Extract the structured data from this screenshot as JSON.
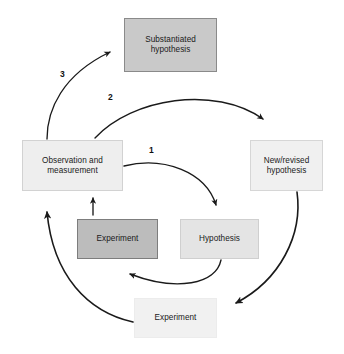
{
  "diagram": {
    "background_color": "#ffffff",
    "nodes": {
      "substantiated_hypothesis": {
        "label": "Substantiated\nhypothesis",
        "fill": "#c9c9c9",
        "border": "#8a8a8a"
      },
      "observation_and_measurement": {
        "label": "Observation and\nmeasurement",
        "fill": "#eeeeee",
        "border": "#d2d2d2"
      },
      "new_revised_hypothesis": {
        "label": "New/revised\nhypothesis",
        "fill": "#f0f0f0",
        "border": "#d6d6d6"
      },
      "experiment_inner": {
        "label": "Experiment",
        "fill": "#bcbcbc",
        "border": "#7d7d7d"
      },
      "hypothesis": {
        "label": "Hypothesis",
        "fill": "#e4e4e4",
        "border": "#cfcfcf"
      },
      "experiment_bottom": {
        "label": "Experiment",
        "fill": "#f1f1f1",
        "border": "#ececec"
      }
    },
    "step_labels": {
      "one": "1",
      "two": "2",
      "three": "3"
    },
    "arrow_color": "#1a1a1a",
    "arrows": [
      {
        "name": "observation-to-hypothesis",
        "step": "1",
        "from": "observation_and_measurement",
        "to": "hypothesis"
      },
      {
        "name": "observation-to-new-revised-hypothesis",
        "step": "2",
        "from": "observation_and_measurement",
        "to": "new_revised_hypothesis"
      },
      {
        "name": "observation-to-substantiated-hypothesis",
        "step": "3",
        "from": "observation_and_measurement",
        "to": "substantiated_hypothesis"
      },
      {
        "name": "hypothesis-to-experiment-inner",
        "step": "",
        "from": "hypothesis",
        "to": "experiment_inner"
      },
      {
        "name": "experiment-inner-to-observation",
        "step": "",
        "from": "experiment_inner",
        "to": "observation_and_measurement"
      },
      {
        "name": "new-revised-hypothesis-to-experiment-bottom",
        "step": "",
        "from": "new_revised_hypothesis",
        "to": "experiment_bottom"
      },
      {
        "name": "experiment-bottom-to-observation",
        "step": "",
        "from": "experiment_bottom",
        "to": "observation_and_measurement"
      }
    ]
  }
}
